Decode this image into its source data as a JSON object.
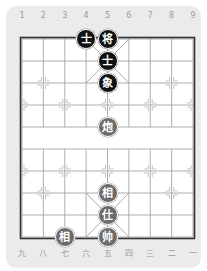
{
  "board": {
    "origin_x": 22,
    "origin_y": 39,
    "col_spacing": 21.375,
    "row_spacing": 22,
    "files": 9,
    "ranks": 10,
    "colors": {
      "card_background": "#ebebeb",
      "board_background": "#ffffff",
      "grid_line": "#9a9a9a",
      "border_line": "#333333",
      "marker": "#c4c4c4",
      "black_piece": "#111111",
      "red_piece": "#6b6b6b",
      "piece_text": "#ffffff",
      "label_text": "#9a9a9a"
    }
  },
  "labels": {
    "top": [
      "1",
      "2",
      "3",
      "4",
      "5",
      "6",
      "7",
      "8",
      "9"
    ],
    "bottom": [
      "九",
      "八",
      "七",
      "六",
      "五",
      "四",
      "三",
      "二",
      "一"
    ]
  },
  "pieces": [
    {
      "side": "black",
      "char": "士",
      "name": "black-advisor",
      "col": 3,
      "row": 0
    },
    {
      "side": "black",
      "char": "将",
      "name": "black-general",
      "col": 4,
      "row": 0
    },
    {
      "side": "black",
      "char": "士",
      "name": "black-advisor",
      "col": 4,
      "row": 1
    },
    {
      "side": "black",
      "char": "象",
      "name": "black-elephant",
      "col": 4,
      "row": 2
    },
    {
      "side": "red",
      "char": "炮",
      "name": "red-cannon",
      "col": 4,
      "row": 4
    },
    {
      "side": "red",
      "char": "相",
      "name": "red-elephant",
      "col": 4,
      "row": 7
    },
    {
      "side": "red",
      "char": "仕",
      "name": "red-advisor",
      "col": 4,
      "row": 8
    },
    {
      "side": "red",
      "char": "帅",
      "name": "red-general",
      "col": 4,
      "row": 9
    },
    {
      "side": "red",
      "char": "相",
      "name": "red-elephant",
      "col": 2,
      "row": 9
    }
  ],
  "markers": [
    {
      "col": 1,
      "row": 2
    },
    {
      "col": 7,
      "row": 2
    },
    {
      "col": 0,
      "row": 3
    },
    {
      "col": 2,
      "row": 3
    },
    {
      "col": 4,
      "row": 3
    },
    {
      "col": 6,
      "row": 3
    },
    {
      "col": 8,
      "row": 3
    },
    {
      "col": 0,
      "row": 6
    },
    {
      "col": 2,
      "row": 6
    },
    {
      "col": 4,
      "row": 6
    },
    {
      "col": 6,
      "row": 6
    },
    {
      "col": 8,
      "row": 6
    },
    {
      "col": 1,
      "row": 7
    },
    {
      "col": 7,
      "row": 7
    }
  ]
}
